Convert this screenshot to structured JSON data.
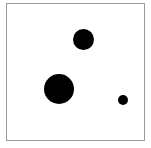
{
  "figure": {
    "title": "",
    "background_color": "#ffffff",
    "frame": {
      "border_color": "#9a9a9a",
      "fill_color": "#ffffff",
      "x": 6,
      "y": 3,
      "width": 139,
      "height": 138
    }
  },
  "chart_data": {
    "type": "scatter",
    "title": "",
    "subtitle": "",
    "xlabel": "",
    "ylabel": "",
    "xlim": [
      0,
      139
    ],
    "ylim": [
      0,
      138
    ],
    "grid": false,
    "legend": null,
    "axis_ticks": {
      "x": [],
      "y": []
    },
    "marker_shape": "circle",
    "marker_color": "#000000",
    "series": [
      {
        "name": "points",
        "color": "#000000",
        "points": [
          {
            "label": "top-circle",
            "x": 77.5,
            "y": 101.5,
            "radius": 10.5,
            "diameter": 21
          },
          {
            "label": "large-circle",
            "x": 53.0,
            "y": 52.0,
            "radius": 15.0,
            "diameter": 30
          },
          {
            "label": "small-circle",
            "x": 118.0,
            "y": 41.0,
            "radius": 5.0,
            "diameter": 10
          }
        ]
      }
    ]
  }
}
